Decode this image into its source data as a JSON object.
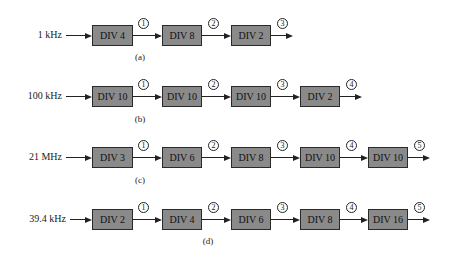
{
  "diagrams": [
    {
      "caption": "(a)",
      "input": "1 kHz",
      "stages": [
        "DIV 4",
        "DIV 8",
        "DIV 2"
      ],
      "nodes": [
        "1",
        "2",
        "3"
      ]
    },
    {
      "caption": "(b)",
      "input": "100 kHz",
      "stages": [
        "DIV 10",
        "DIV 10",
        "DIV 10",
        "DIV 2"
      ],
      "nodes": [
        "1",
        "2",
        "3",
        "4"
      ]
    },
    {
      "caption": "(c)",
      "input": "21 MHz",
      "stages": [
        "DIV 3",
        "DIV 6",
        "DIV 8",
        "DIV 10",
        "DIV 10"
      ],
      "nodes": [
        "1",
        "2",
        "3",
        "4",
        "5"
      ]
    },
    {
      "caption": "(d)",
      "input": "39.4 kHz",
      "stages": [
        "DIV 2",
        "DIV 4",
        "DIV 6",
        "DIV 8",
        "DIV 16"
      ],
      "nodes": [
        "1",
        "2",
        "3",
        "4",
        "5"
      ]
    }
  ],
  "colors": {
    "box_fill": "#8a8a8a",
    "box_border": "#2a2a2a",
    "line": "#222222"
  }
}
